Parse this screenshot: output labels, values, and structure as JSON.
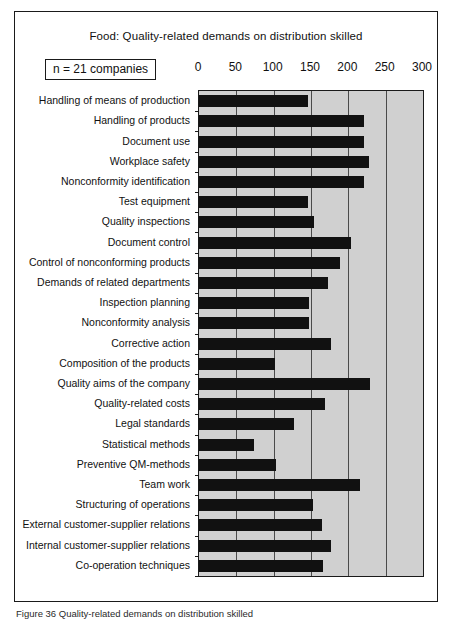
{
  "figure": {
    "caption": "Figure 36  Quality-related demands on distribution skilled"
  },
  "chart_data": {
    "type": "bar",
    "orientation": "horizontal",
    "title": "Food: Quality-related demands on distribution skilled",
    "sample_size_label": "n = 21 companies",
    "xlabel": "",
    "ylabel": "",
    "xlim": [
      0,
      300
    ],
    "xticks": [
      0,
      50,
      100,
      150,
      200,
      250,
      300
    ],
    "xtick_labels": [
      "0",
      "50",
      "100",
      "150",
      "200",
      "250",
      "300"
    ],
    "grid": true,
    "legend": "none",
    "plot_background_color": "#d0d0d0",
    "bar_color": "#111111",
    "categories": [
      "Handling of means of production",
      "Handling of products",
      "Document use",
      "Workplace safety",
      "Nonconformity identification",
      "Test equipment",
      "Quality inspections",
      "Document control",
      "Control of nonconforming products",
      "Demands of related departments",
      "Inspection planning",
      "Nonconformity analysis",
      "Corrective action",
      "Composition of the  products",
      "Quality aims of the company",
      "Quality-related costs",
      "Legal standards",
      "Statistical methods",
      "Preventive QM-methods",
      "Team work",
      "Structuring of operations",
      "External customer-supplier relations",
      "Internal customer-supplier relations",
      "Co-operation techniques"
    ],
    "values": [
      146,
      221,
      221,
      228,
      221,
      146,
      154,
      203,
      189,
      173,
      147,
      147,
      177,
      102,
      229,
      169,
      127,
      74,
      103,
      216,
      153,
      165,
      177,
      166
    ]
  }
}
